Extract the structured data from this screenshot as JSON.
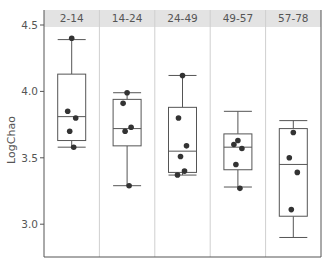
{
  "chart_data": {
    "type": "box",
    "title": "",
    "xlabel": "",
    "ylabel": "LogChao",
    "ylim": [
      2.82,
      4.58
    ],
    "yticks": [
      3.0,
      3.5,
      4.0,
      4.5
    ],
    "ytick_labels": [
      "3.0",
      "3.5",
      "4.0",
      "4.5"
    ],
    "grid": false,
    "legend": null,
    "panels": [
      {
        "label": "2-14",
        "box": {
          "whisker_low": 3.58,
          "q1": 3.63,
          "median": 3.81,
          "q3": 4.13,
          "whisker_high": 4.39
        },
        "points": [
          4.4,
          3.85,
          3.8,
          3.7,
          3.58
        ]
      },
      {
        "label": "14-24",
        "box": {
          "whisker_low": 3.29,
          "q1": 3.59,
          "median": 3.72,
          "q3": 3.94,
          "whisker_high": 3.99
        },
        "points": [
          3.99,
          3.91,
          3.73,
          3.7,
          3.29
        ]
      },
      {
        "label": "24-49",
        "box": {
          "whisker_low": 3.37,
          "q1": 3.39,
          "median": 3.55,
          "q3": 3.88,
          "whisker_high": 4.12
        },
        "points": [
          4.12,
          3.8,
          3.59,
          3.51,
          3.4,
          3.37
        ]
      },
      {
        "label": "49-57",
        "box": {
          "whisker_low": 3.28,
          "q1": 3.41,
          "median": 3.58,
          "q3": 3.68,
          "whisker_high": 3.85
        },
        "points": [
          3.63,
          3.6,
          3.57,
          3.45,
          3.27
        ]
      },
      {
        "label": "57-78",
        "box": {
          "whisker_low": 2.9,
          "q1": 3.06,
          "median": 3.45,
          "q3": 3.72,
          "whisker_high": 3.78
        },
        "points": [
          3.69,
          3.5,
          3.39,
          3.11
        ]
      }
    ]
  },
  "colors": {
    "header_bg": "#e3e3e3",
    "box_stroke": "#555555",
    "point_fill": "#333333",
    "divider": "#cfcfcf",
    "axis": "#555555"
  }
}
